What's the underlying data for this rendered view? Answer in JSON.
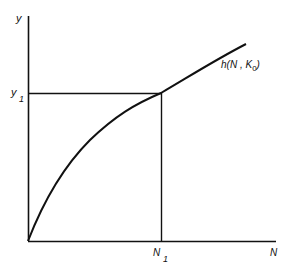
{
  "diagram": {
    "axes": {
      "y_label": "y",
      "x_label": "N"
    },
    "curve": {
      "label_main": "h(N , K",
      "label_sub": "0",
      "label_close": ")"
    },
    "markers": {
      "y1_main": "y",
      "y1_sub": "1",
      "n1_main": "N",
      "n1_sub": "1"
    },
    "colors": {
      "stroke": "#111111",
      "background": "#ffffff"
    }
  }
}
